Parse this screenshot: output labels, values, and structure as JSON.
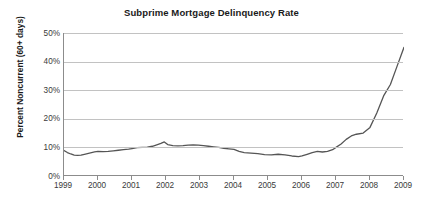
{
  "chart_data": {
    "type": "line",
    "title": "Subprime Mortgage Delinquency Rate",
    "xlabel": "",
    "ylabel": "Percent Noncurrent (60+ days)",
    "xlim": [
      1999,
      2009
    ],
    "ylim": [
      0,
      50
    ],
    "grid": true,
    "legend": "none",
    "line_color": "#555555",
    "grid_color": "#c2c2c2",
    "axis_color": "#8c8c8c",
    "y_ticks": [
      0,
      10,
      20,
      30,
      40,
      50
    ],
    "y_tick_labels": [
      "0%",
      "10%",
      "20%",
      "30%",
      "40%",
      "50%"
    ],
    "x_ticks": [
      1999,
      2000,
      2001,
      2002,
      2003,
      2004,
      2005,
      2006,
      2007,
      2008,
      2009
    ],
    "x_tick_labels": [
      "1999",
      "2000",
      "2001",
      "2002",
      "2003",
      "2004",
      "2005",
      "2006",
      "2007",
      "2008",
      "2009"
    ],
    "series": [
      {
        "name": "Percent Noncurrent (60+ days)",
        "x": [
          1999.0,
          1999.1,
          1999.2,
          1999.3,
          1999.4,
          1999.5,
          1999.6,
          1999.75,
          1999.9,
          2000.0,
          2000.15,
          2000.3,
          2000.45,
          2000.6,
          2000.75,
          2000.9,
          2001.0,
          2001.15,
          2001.3,
          2001.45,
          2001.6,
          2001.75,
          2001.85,
          2001.95,
          2002.05,
          2002.2,
          2002.35,
          2002.5,
          2002.65,
          2002.8,
          2002.95,
          2003.1,
          2003.25,
          2003.4,
          2003.55,
          2003.7,
          2003.85,
          2004.0,
          2004.15,
          2004.3,
          2004.5,
          2004.7,
          2004.9,
          2005.1,
          2005.3,
          2005.5,
          2005.7,
          2005.9,
          2006.0,
          2006.15,
          2006.3,
          2006.45,
          2006.6,
          2006.75,
          2006.9,
          2007.0,
          2007.15,
          2007.3,
          2007.45,
          2007.6,
          2007.8,
          2008.0,
          2008.2,
          2008.4,
          2008.6,
          2008.8,
          2009.0
        ],
        "y": [
          8.9,
          8.2,
          7.7,
          7.3,
          7.2,
          7.3,
          7.6,
          8.0,
          8.4,
          8.6,
          8.5,
          8.6,
          8.8,
          9.0,
          9.2,
          9.4,
          9.6,
          9.9,
          10.0,
          10.1,
          10.4,
          11.0,
          11.4,
          11.9,
          11.0,
          10.6,
          10.5,
          10.6,
          10.8,
          10.9,
          10.8,
          10.6,
          10.4,
          10.2,
          10.0,
          9.7,
          9.5,
          9.3,
          8.6,
          8.2,
          8.0,
          7.8,
          7.5,
          7.4,
          7.6,
          7.4,
          7.0,
          6.8,
          7.0,
          7.6,
          8.2,
          8.6,
          8.4,
          8.6,
          9.2,
          10.0,
          11.2,
          12.8,
          14.0,
          14.6,
          15.0,
          17.0,
          22.0,
          28.0,
          32.0,
          38.5,
          45.0
        ]
      }
    ],
    "annotations": [
      {
        "label": "local peak",
        "x": 2001.95,
        "y": 11.9
      },
      {
        "label": "trough",
        "x": 2005.9,
        "y": 6.8
      },
      {
        "label": "end value",
        "x": 2009.0,
        "y": 45.0
      }
    ]
  }
}
